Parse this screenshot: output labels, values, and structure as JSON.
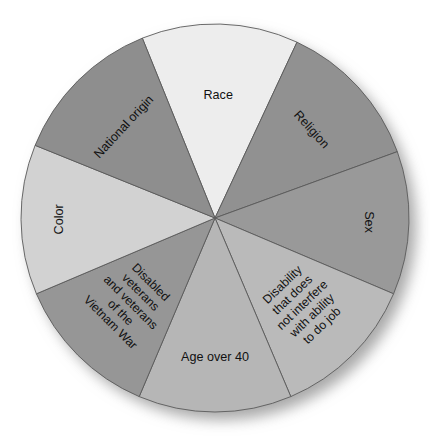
{
  "chart_data": {
    "type": "pie",
    "title": "",
    "subtitle": "",
    "xlabel": "",
    "ylabel": "",
    "grid": false,
    "legend_position": "none",
    "labels_on_slices": true,
    "total_slices": 8,
    "categories": [
      "Race",
      "Religion",
      "Sex",
      "Disability that does not interfere with ability to do job",
      "Age over 40",
      "Disabled veterans and veterans of the Vietnam War",
      "Color",
      "National origin"
    ],
    "values": [
      12.5,
      12.5,
      12.5,
      12.5,
      12.5,
      12.5,
      12.5,
      12.5
    ],
    "series": [
      {
        "name": "Protected classes",
        "values": [
          12.5,
          12.5,
          12.5,
          12.5,
          12.5,
          12.5,
          12.5,
          12.5
        ]
      }
    ],
    "slices": [
      {
        "id": "race",
        "label": "Race",
        "lines": [
          "Race"
        ],
        "value": 12.5,
        "start_angle": -22,
        "end_angle": 25,
        "color": "#ededed",
        "label_rotation": 0,
        "label_radius": 0.63
      },
      {
        "id": "religion",
        "label": "Religion",
        "lines": [
          "Religion"
        ],
        "value": 12.5,
        "start_angle": 25,
        "end_angle": 70,
        "color": "#919191",
        "label_rotation": 48,
        "label_radius": 0.67
      },
      {
        "id": "sex",
        "label": "Sex",
        "lines": [
          "Sex"
        ],
        "value": 12.5,
        "start_angle": 70,
        "end_angle": 113,
        "color": "#999999",
        "label_rotation": 90,
        "label_radius": 0.79
      },
      {
        "id": "disability",
        "label": "Disability that does not interfere with ability to do job",
        "lines": [
          "Disability",
          "that does",
          "not interfere",
          "with ability",
          "to do job"
        ],
        "value": 12.5,
        "start_angle": 113,
        "end_angle": 157,
        "color": "#bababa",
        "label_rotation": -44,
        "label_radius": 0.64
      },
      {
        "id": "age-over-40",
        "label": "Age over 40",
        "lines": [
          "Age over 40"
        ],
        "value": 12.5,
        "start_angle": 157,
        "end_angle": 203,
        "color": "#b6b6b6",
        "label_rotation": 0,
        "label_radius": 0.72
      },
      {
        "id": "disabled-veterans",
        "label": "Disabled veterans and veterans of the Vietnam War",
        "lines": [
          "Disabled",
          "veterans",
          "and veterans",
          "of the",
          "Vietnam War"
        ],
        "value": 12.5,
        "start_angle": 203,
        "end_angle": 247,
        "color": "#969696",
        "label_rotation": 45,
        "label_radius": 0.62
      },
      {
        "id": "color",
        "label": "Color",
        "lines": [
          "Color"
        ],
        "value": 12.5,
        "start_angle": 247,
        "end_angle": 292,
        "color": "#d2d2d2",
        "label_rotation": -90,
        "label_radius": 0.8
      },
      {
        "id": "national-origin",
        "label": "National origin",
        "lines": [
          "National origin"
        ],
        "value": 12.5,
        "start_angle": 292,
        "end_angle": 338,
        "color": "#8e8e8e",
        "label_rotation": -47,
        "label_radius": 0.66
      }
    ],
    "geometry": {
      "center_x": 215,
      "center_y": 218,
      "radius": 194
    },
    "style": {
      "slice_border_color": "#5a5a5a",
      "background_color": "#ffffff",
      "shadow_color": "#b0b0b0",
      "text_color": "#111111"
    }
  }
}
